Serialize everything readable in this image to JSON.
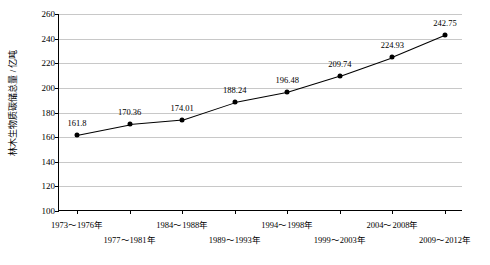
{
  "chart_data": {
    "type": "line",
    "title": "",
    "xlabel": "",
    "ylabel": "林木生物质碳储总量 / 亿吨",
    "ylim": [
      100,
      260
    ],
    "yticks": [
      100,
      120,
      140,
      160,
      180,
      200,
      220,
      240,
      260
    ],
    "grid": true,
    "legend": "none",
    "categories": [
      "1973～1976年",
      "1977～1981年",
      "1984～1988年",
      "1989～1993年",
      "1994～1998年",
      "1999～2003年",
      "2004～2008年",
      "2009～2012年"
    ],
    "values": [
      161.8,
      170.36,
      174.01,
      188.24,
      196.48,
      209.74,
      224.93,
      242.75
    ],
    "data_labels": [
      "161.8",
      "170.36",
      "174.01",
      "188.24",
      "196.48",
      "209.74",
      "224.93",
      "242.75"
    ],
    "marker": "filled-circle",
    "line_color": "#000000"
  }
}
